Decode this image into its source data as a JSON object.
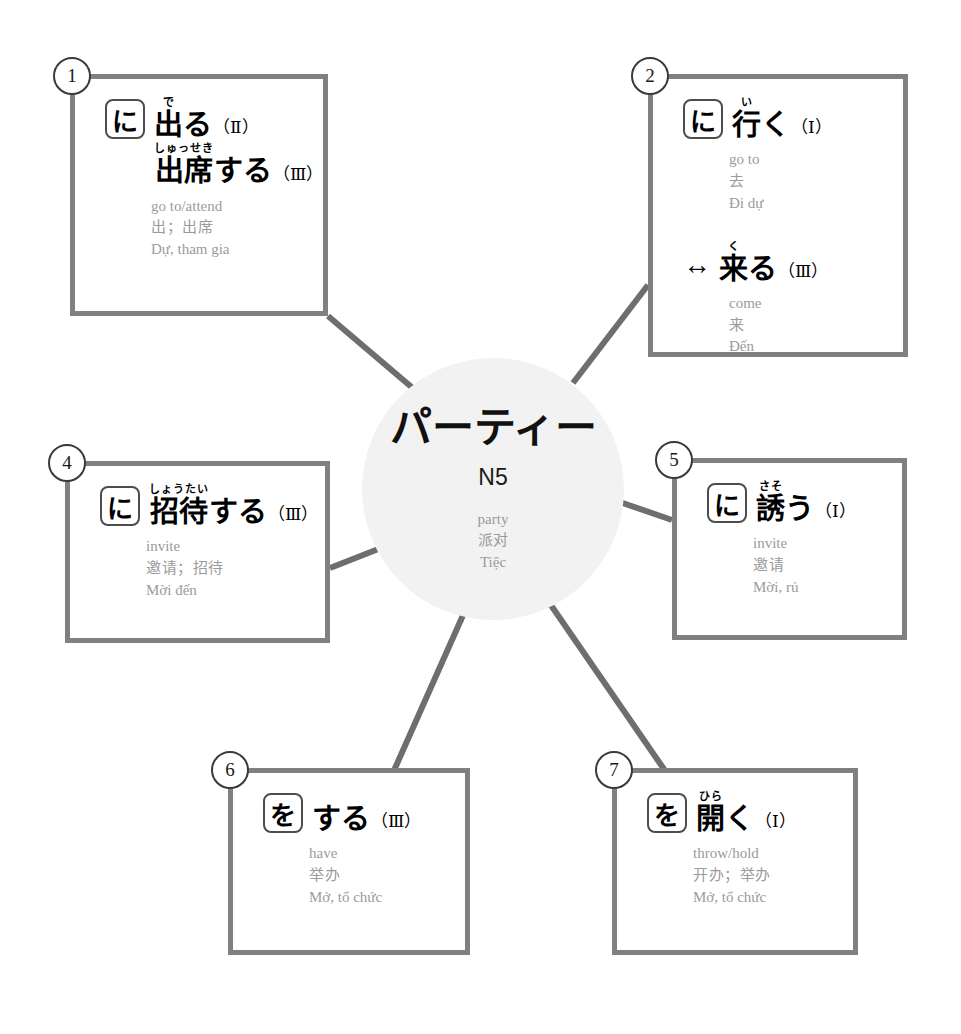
{
  "center": {
    "title": "パーティー",
    "level": "N5",
    "gloss_en": "party",
    "gloss_zh": "派对",
    "gloss_vi": "Tiệc"
  },
  "colors": {
    "card_border": "#808080",
    "center_fill": "#f2f2f2",
    "gloss_text": "#9b9b9b",
    "headword_text": "#000000",
    "connector": "#6e6e6e"
  },
  "cards": [
    {
      "number": "1",
      "entries": [
        {
          "particle": "に",
          "arrow": "",
          "lines": [
            {
              "furigana": "で",
              "kanji": "出",
              "okurigana": "る",
              "group": "（Ⅱ）"
            },
            {
              "furigana": "しゅっせき",
              "kanji": "出席",
              "okurigana": "する",
              "group": "（Ⅲ）"
            }
          ],
          "gloss_en": "go to/attend",
          "gloss_zh": "出；出席",
          "gloss_vi": "Dự, tham gia"
        }
      ]
    },
    {
      "number": "2",
      "entries": [
        {
          "particle": "に",
          "arrow": "",
          "lines": [
            {
              "furigana": "い",
              "kanji": "行",
              "okurigana": "く",
              "group": "（Ⅰ）"
            }
          ],
          "gloss_en": "go to",
          "gloss_zh": "去",
          "gloss_vi": "Đi dự"
        },
        {
          "particle": "",
          "arrow": "↔",
          "lines": [
            {
              "furigana": "く",
              "kanji": "来",
              "okurigana": "る",
              "group": "（Ⅲ）"
            }
          ],
          "gloss_en": "come",
          "gloss_zh": "来",
          "gloss_vi": "Đến"
        }
      ]
    },
    {
      "number": "4",
      "entries": [
        {
          "particle": "に",
          "arrow": "",
          "lines": [
            {
              "furigana": "しょうたい",
              "kanji": "招待",
              "okurigana": "する",
              "group": "（Ⅲ）"
            }
          ],
          "gloss_en": "invite",
          "gloss_zh": "邀请；招待",
          "gloss_vi": "Mời đến"
        }
      ]
    },
    {
      "number": "5",
      "entries": [
        {
          "particle": "に",
          "arrow": "",
          "lines": [
            {
              "furigana": "さそ",
              "kanji": "誘",
              "okurigana": "う",
              "group": "（Ⅰ）"
            }
          ],
          "gloss_en": "invite",
          "gloss_zh": "邀请",
          "gloss_vi": "Mời, rủ"
        }
      ]
    },
    {
      "number": "6",
      "entries": [
        {
          "particle": "を",
          "arrow": "",
          "lines": [
            {
              "furigana": "",
              "kanji": "",
              "okurigana": "する",
              "group": "（Ⅲ）"
            }
          ],
          "gloss_en": "have",
          "gloss_zh": "举办",
          "gloss_vi": "Mở, tổ chức"
        }
      ]
    },
    {
      "number": "7",
      "entries": [
        {
          "particle": "を",
          "arrow": "",
          "lines": [
            {
              "furigana": "ひら",
              "kanji": "開",
              "okurigana": "く",
              "group": "（Ⅰ）"
            }
          ],
          "gloss_en": "throw/hold",
          "gloss_zh": "开办；举办",
          "gloss_vi": "Mở, tổ chức"
        }
      ]
    }
  ]
}
